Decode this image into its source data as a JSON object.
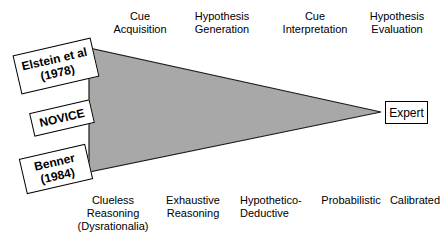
{
  "figure": {
    "wedge": {
      "fill_color": "#a8a8a8",
      "stroke_color": "#1a1a1a"
    },
    "top_labels": [
      {
        "text": "Cue\nAcquisition",
        "left": 103,
        "width": 74
      },
      {
        "text": "Hypothesis\nGeneration",
        "left": 183,
        "width": 78
      },
      {
        "text": "Cue\nInterpretation",
        "left": 276,
        "width": 78
      },
      {
        "text": "Hypothesis\nEvaluation",
        "left": 358,
        "width": 78
      }
    ],
    "bottom_labels": [
      {
        "text": "Clueless\nReasoning\n(Dysrationalia)",
        "left": 73,
        "width": 80,
        "align": "center"
      },
      {
        "text": "Exhaustive\nReasoning",
        "left": 157,
        "width": 72,
        "align": "center"
      },
      {
        "text": "Hypothetico-\nDeductive",
        "left": 240,
        "width": 72,
        "align": "left"
      },
      {
        "text": "Probabilistic",
        "left": 316,
        "width": 70,
        "align": "center"
      },
      {
        "text": "Calibrated",
        "left": 388,
        "width": 54,
        "align": "center"
      }
    ],
    "tag_boxes": [
      {
        "name": "elstein",
        "lines": [
          "Elstein et al",
          "(1978)"
        ],
        "left": 16,
        "top": 46,
        "width": 80,
        "height": 40
      },
      {
        "name": "novice",
        "lines": [
          "NOVICE"
        ],
        "left": 31,
        "top": 106,
        "width": 62,
        "height": 24
      },
      {
        "name": "benner",
        "lines": [
          "Benner",
          "(1984)"
        ],
        "left": 22,
        "top": 151,
        "width": 68,
        "height": 36
      }
    ],
    "expert_box": {
      "label": "Expert",
      "left": 385,
      "top": 101,
      "width": 43,
      "height": 23
    }
  }
}
